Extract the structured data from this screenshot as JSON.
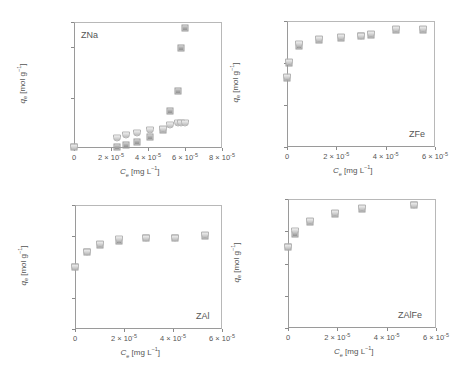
{
  "figure": {
    "panels": [
      {
        "id": "ZNa",
        "tag": "ZNa",
        "tag_position": "top-left",
        "frame": {
          "left": 74,
          "top": 22,
          "width": 148,
          "height": 126
        },
        "y_ticks": [
          {
            "label": "0",
            "value": 0
          },
          {
            "label": "4 × 10",
            "exp": "-6",
            "value": 4e-06
          },
          {
            "label": "8 × 10",
            "exp": "-6",
            "value": 8e-06
          },
          {
            "label": "1 × 10",
            "exp": "-5",
            "value": 1e-05
          }
        ],
        "x_ticks": [
          {
            "label": "0",
            "value": 0
          },
          {
            "label": "2 × 10",
            "exp": "-5",
            "value": 2e-05
          },
          {
            "label": "4 × 10",
            "exp": "-5",
            "value": 4e-05
          },
          {
            "label": "6 × 10",
            "exp": "-5",
            "value": 6e-05
          },
          {
            "label": "8 × 10",
            "exp": "-5",
            "value": 8e-05
          }
        ],
        "xlim": [
          0,
          8e-05
        ],
        "ylim": [
          0,
          1e-05
        ]
      },
      {
        "id": "ZFe",
        "tag": "ZFe",
        "tag_position": "bottom-right",
        "frame": {
          "left": 287,
          "top": 21,
          "width": 148,
          "height": 126
        },
        "y_ticks": [
          {
            "label": "0",
            "value": 0
          },
          {
            "label": "2 × 10",
            "exp": "-5",
            "value": 2e-05
          },
          {
            "label": "4 × 10",
            "exp": "-5",
            "value": 4e-05
          },
          {
            "label": "6 × 10",
            "exp": "-5",
            "value": 6e-05
          }
        ],
        "x_ticks": [
          {
            "label": "0",
            "value": 0
          },
          {
            "label": "2 × 10",
            "exp": "-5",
            "value": 2e-05
          },
          {
            "label": "4 × 10",
            "exp": "-5",
            "value": 4e-05
          },
          {
            "label": "6 × 10",
            "exp": "-5",
            "value": 6e-05
          }
        ],
        "xlim": [
          0,
          6e-05
        ],
        "ylim": [
          0,
          6e-05
        ]
      },
      {
        "id": "ZAl",
        "tag": "ZAl",
        "tag_position": "bottom-right",
        "frame": {
          "left": 75,
          "top": 205,
          "width": 147,
          "height": 124
        },
        "y_ticks": [
          {
            "label": "0",
            "value": 0
          },
          {
            "label": "1 × 10",
            "exp": "-5",
            "value": 1e-05
          },
          {
            "label": "2 × 10",
            "exp": "-5",
            "value": 2e-05
          },
          {
            "label": "3 × 10",
            "exp": "-5",
            "value": 3e-05
          },
          {
            "label": "4 × 10",
            "exp": "-5",
            "value": 4e-05
          }
        ],
        "x_ticks": [
          {
            "label": "0",
            "value": 0
          },
          {
            "label": "2 × 10",
            "exp": "-5",
            "value": 2e-05
          },
          {
            "label": "4 × 10",
            "exp": "-5",
            "value": 4e-05
          },
          {
            "label": "6 × 10",
            "exp": "-5",
            "value": 6e-05
          }
        ],
        "xlim": [
          0,
          6e-05
        ],
        "ylim": [
          0,
          4e-05
        ]
      },
      {
        "id": "ZAlFe",
        "tag": "ZAlFe",
        "tag_position": "bottom-right",
        "frame": {
          "left": 288,
          "top": 199,
          "width": 148,
          "height": 129
        },
        "y_ticks": [
          {
            "label": "0",
            "value": 0
          },
          {
            "label": "2 × 10",
            "exp": "-5",
            "value": 2e-05
          },
          {
            "label": "4 × 10",
            "exp": "-5",
            "value": 4e-05
          },
          {
            "label": "6 × 10",
            "exp": "-5",
            "value": 6e-05
          },
          {
            "label": "8 × 10",
            "exp": "-5",
            "value": 8e-05
          }
        ],
        "x_ticks": [
          {
            "label": "0",
            "value": 0
          },
          {
            "label": "2 × 10",
            "exp": "-5",
            "value": 2e-05
          },
          {
            "label": "4 × 10",
            "exp": "-5",
            "value": 4e-05
          },
          {
            "label": "6 × 10",
            "exp": "-5",
            "value": 6e-05
          }
        ],
        "xlim": [
          0,
          6e-05
        ],
        "ylim": [
          0,
          8e-05
        ]
      }
    ],
    "xlabel": {
      "main": "C",
      "sub": "e",
      "unit": " [mg L",
      "sup": "−1",
      "close": "]"
    },
    "ylabel": {
      "main": "q",
      "sub": "e",
      "unit": " [mol g",
      "sup": "−1",
      "close": "]"
    }
  },
  "chart_data": [
    {
      "type": "scatter",
      "title": "ZNa",
      "xlabel": "Ce [mg L−1]",
      "ylabel": "qe [mol g−1]",
      "xlim": [
        0,
        8e-05
      ],
      "ylim": [
        0,
        1e-05
      ],
      "grid": false,
      "legend": "none",
      "series": [
        {
          "name": "squares",
          "marker": "square",
          "x": [
            0.0,
            2.3e-05,
            2.8e-05,
            3.4e-05,
            4.1e-05,
            4.8e-05,
            5.2e-05,
            5.6e-05,
            5.8e-05,
            6e-05
          ],
          "y": [
            1e-07,
            1e-07,
            2e-07,
            5e-07,
            9e-07,
            1.4e-06,
            2.9e-06,
            4.5e-06,
            7.9e-06,
            9.5e-06
          ]
        },
        {
          "name": "circles",
          "marker": "circle",
          "x": [
            0.0,
            2.3e-05,
            2.8e-05,
            3.4e-05,
            4.1e-05,
            4.8e-05,
            5.2e-05,
            5.6e-05,
            5.8e-05,
            6e-05
          ],
          "y": [
            1e-07,
            8e-07,
            1e-06,
            1.2e-06,
            1.4e-06,
            1.5e-06,
            1.8e-06,
            2e-06,
            2e-06,
            2e-06
          ]
        }
      ]
    },
    {
      "type": "scatter",
      "title": "ZFe",
      "xlabel": "Ce [mg L−1]",
      "ylabel": "qe [mol g−1]",
      "xlim": [
        0,
        6e-05
      ],
      "ylim": [
        0,
        6e-05
      ],
      "grid": false,
      "legend": "none",
      "series": [
        {
          "name": "squares",
          "marker": "square",
          "x": [
            0.0,
            1e-06,
            5e-06,
            1.3e-05,
            2.2e-05,
            3e-05,
            3.4e-05,
            4.4e-05,
            5.5e-05
          ],
          "y": [
            3.3e-05,
            4e-05,
            4.8e-05,
            5.1e-05,
            5.2e-05,
            5.3e-05,
            5.35e-05,
            5.55e-05,
            5.55e-05
          ]
        },
        {
          "name": "circles",
          "marker": "circle",
          "x": [
            0.0,
            1e-06,
            5e-06,
            1.3e-05,
            2.2e-05,
            3e-05,
            3.4e-05,
            4.4e-05,
            5.5e-05
          ],
          "y": [
            3.35e-05,
            4.05e-05,
            4.9e-05,
            5.15e-05,
            5.25e-05,
            5.3e-05,
            5.4e-05,
            5.6e-05,
            5.6e-05
          ]
        }
      ]
    },
    {
      "type": "scatter",
      "title": "ZAl",
      "xlabel": "Ce [mg L−1]",
      "ylabel": "qe [mol g−1]",
      "xlim": [
        0,
        6e-05
      ],
      "ylim": [
        0,
        4e-05
      ],
      "grid": false,
      "legend": "none",
      "series": [
        {
          "name": "squares",
          "marker": "square",
          "x": [
            0.0,
            5e-06,
            1e-05,
            1.8e-05,
            2.9e-05,
            4.1e-05,
            5.3e-05
          ],
          "y": [
            2e-05,
            2.5e-05,
            2.7e-05,
            2.85e-05,
            2.95e-05,
            2.95e-05,
            3e-05
          ]
        },
        {
          "name": "circles",
          "marker": "circle",
          "x": [
            0.0,
            5e-06,
            1e-05,
            1.8e-05,
            2.9e-05,
            4.1e-05,
            5.3e-05
          ],
          "y": [
            2e-05,
            2.5e-05,
            2.75e-05,
            2.9e-05,
            2.95e-05,
            2.95e-05,
            3.02e-05
          ]
        }
      ]
    },
    {
      "type": "scatter",
      "title": "ZAlFe",
      "xlabel": "Ce [mg L−1]",
      "ylabel": "qe [mol g−1]",
      "xlim": [
        0,
        6e-05
      ],
      "ylim": [
        0,
        8e-05
      ],
      "grid": false,
      "legend": "none",
      "series": [
        {
          "name": "squares",
          "marker": "square",
          "x": [
            0.0,
            3e-06,
            9e-06,
            1.9e-05,
            3e-05,
            5.1e-05
          ],
          "y": [
            5e-05,
            5.8e-05,
            6.6e-05,
            7.1e-05,
            7.4e-05,
            7.6e-05
          ]
        },
        {
          "name": "circles",
          "marker": "circle",
          "x": [
            0.0,
            3e-06,
            9e-06,
            1.9e-05,
            3e-05,
            5.1e-05
          ],
          "y": [
            5.05e-05,
            6e-05,
            6.65e-05,
            7.15e-05,
            7.45e-05,
            7.65e-05
          ]
        }
      ]
    }
  ]
}
